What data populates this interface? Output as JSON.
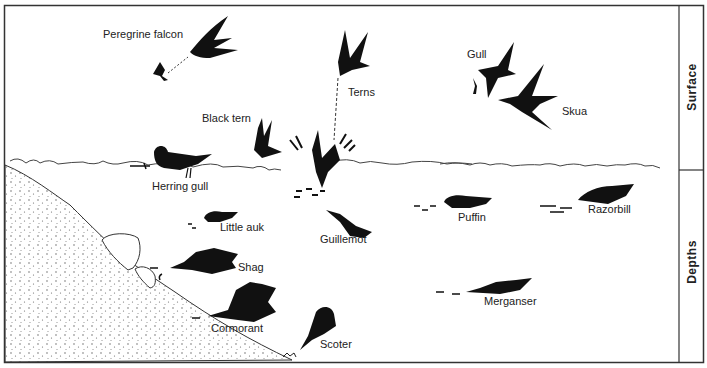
{
  "diagram": {
    "zones": [
      {
        "label": "Surface"
      },
      {
        "label": "Depths"
      }
    ],
    "birds": [
      {
        "name": "Peregrine falcon",
        "zone": "Surface"
      },
      {
        "name": "Terns",
        "zone": "Surface"
      },
      {
        "name": "Gull",
        "zone": "Surface"
      },
      {
        "name": "Skua",
        "zone": "Surface"
      },
      {
        "name": "Black tern",
        "zone": "Surface"
      },
      {
        "name": "Herring gull",
        "zone": "Surface"
      },
      {
        "name": "Little auk",
        "zone": "Depths"
      },
      {
        "name": "Guillemot",
        "zone": "Depths"
      },
      {
        "name": "Puffin",
        "zone": "Depths"
      },
      {
        "name": "Razorbill",
        "zone": "Depths"
      },
      {
        "name": "Shag",
        "zone": "Depths"
      },
      {
        "name": "Cormorant",
        "zone": "Depths"
      },
      {
        "name": "Merganser",
        "zone": "Depths"
      },
      {
        "name": "Scoter",
        "zone": "Depths"
      }
    ],
    "colors": {
      "ink": "#111111",
      "line": "#333333",
      "background": "#ffffff",
      "stipple": "#555555"
    }
  }
}
